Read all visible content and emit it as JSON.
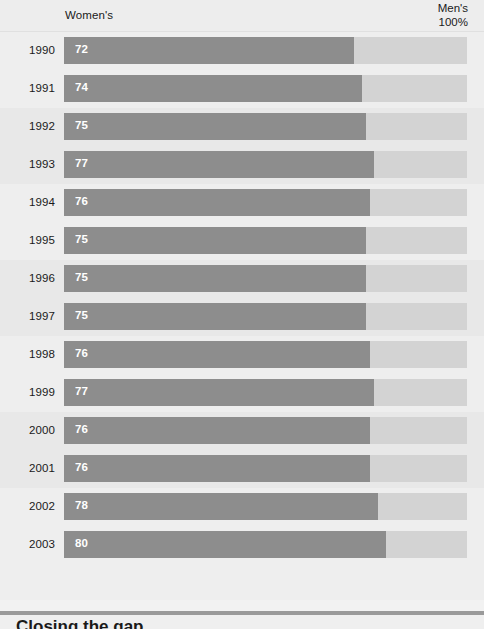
{
  "header": {
    "left_label": "Women's",
    "right_label_line1": "Men's",
    "right_label_line2": "100%"
  },
  "footer": {
    "caption": "Closing the gap"
  },
  "colors": {
    "bar_fill": "#8d8d8d",
    "bar_track": "#d3d3d3",
    "panel_background": "#ebebeb",
    "band_background": "#eeeeee",
    "band_alt_background": "#e8e8e8",
    "value_text": "#ffffff",
    "label_text": "#1a1a1a",
    "footer_rule": "#9a9a9a"
  },
  "chart_data": {
    "type": "bar",
    "orientation": "horizontal",
    "title": "",
    "subtitle": "",
    "xlabel": "",
    "ylabel": "",
    "xlim": [
      0,
      100
    ],
    "grid": false,
    "legend": false,
    "value_suffix": "",
    "axis_note_left": "Women's",
    "axis_note_right": "Men's 100%",
    "categories": [
      "1990",
      "1991",
      "1992",
      "1993",
      "1994",
      "1995",
      "1996",
      "1997",
      "1998",
      "1999",
      "2000",
      "2001",
      "2002",
      "2003"
    ],
    "values": [
      72,
      74,
      75,
      77,
      76,
      75,
      75,
      75,
      76,
      77,
      76,
      76,
      78,
      80
    ],
    "series": [
      {
        "name": "Women's earnings as percent of men's",
        "values": [
          72,
          74,
          75,
          77,
          76,
          75,
          75,
          75,
          76,
          77,
          76,
          76,
          78,
          80
        ]
      }
    ],
    "rows": [
      {
        "year": "1990",
        "value": 72,
        "label": "72"
      },
      {
        "year": "1991",
        "value": 74,
        "label": "74"
      },
      {
        "year": "1992",
        "value": 75,
        "label": "75"
      },
      {
        "year": "1993",
        "value": 77,
        "label": "77"
      },
      {
        "year": "1994",
        "value": 76,
        "label": "76"
      },
      {
        "year": "1995",
        "value": 75,
        "label": "75"
      },
      {
        "year": "1996",
        "value": 75,
        "label": "75"
      },
      {
        "year": "1997",
        "value": 75,
        "label": "75"
      },
      {
        "year": "1998",
        "value": 76,
        "label": "76"
      },
      {
        "year": "1999",
        "value": 77,
        "label": "77"
      },
      {
        "year": "2000",
        "value": 76,
        "label": "76"
      },
      {
        "year": "2001",
        "value": 76,
        "label": "76"
      },
      {
        "year": "2002",
        "value": 78,
        "label": "78"
      },
      {
        "year": "2003",
        "value": 80,
        "label": "80"
      }
    ]
  }
}
